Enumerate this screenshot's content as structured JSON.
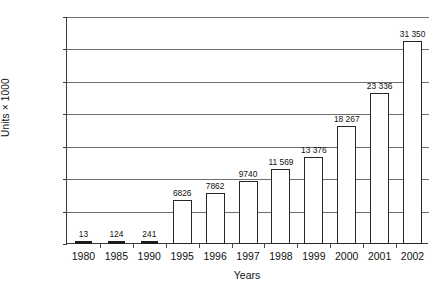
{
  "chart_data": {
    "type": "bar",
    "title": "",
    "xlabel": "Years",
    "ylabel": "Units × 1000",
    "categories": [
      "1980",
      "1985",
      "1990",
      "1995",
      "1996",
      "1997",
      "1998",
      "1999",
      "2000",
      "2001",
      "2002"
    ],
    "values": [
      13,
      124,
      241,
      6826,
      7862,
      9740,
      11569,
      13376,
      18267,
      23336,
      31350
    ],
    "value_labels": [
      "13",
      "124",
      "241",
      "6826",
      "7862",
      "9740",
      "11 569",
      "13 376",
      "18 267",
      "23 336",
      "31 350"
    ],
    "ylim": [
      0,
      35000
    ],
    "ytick_values": [
      0,
      5000,
      10000,
      15000,
      20000,
      25000,
      30000,
      35000
    ],
    "ytick_labels": [
      "0",
      "5000",
      "10 000",
      "15 000",
      "20 000",
      "25 000",
      "30 000",
      "35 000"
    ],
    "grid": true,
    "legend": null,
    "bar_fill_color": "#ffffff",
    "bar_border_color": "#262626",
    "gridline_color": "#6f6f6f",
    "axis_color": "#3a3a3a",
    "background_color": "#ffffff"
  }
}
